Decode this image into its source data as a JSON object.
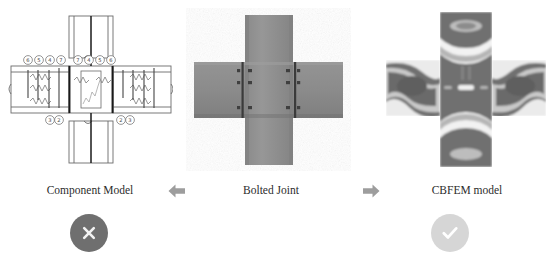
{
  "figure": {
    "background_color": "#ffffff"
  },
  "panels": [
    {
      "id": "component-model",
      "caption": "Component Model",
      "type": "line-drawing",
      "description": "Schematic component method model of a bolted beam-to-column joint with spring components",
      "component_labels_top": [
        "6",
        "5",
        "4",
        "7",
        "7",
        "4",
        "5",
        "6"
      ],
      "component_labels_bottom": [
        "3",
        "2",
        "2",
        "3"
      ],
      "stroke_color": "#555555",
      "fill_color": "#ffffff"
    },
    {
      "id": "bolted-joint",
      "caption": "Bolted Joint",
      "type": "photo",
      "description": "Grayscale photo of a cruciform bolted end-plate joint, column vertical and beams horizontal",
      "base_color": "#8c8c8c",
      "column_color": "#8f8f8f",
      "plate_color": "#4a4a4a",
      "bolt_count": 8
    },
    {
      "id": "cbfem-model",
      "caption": "CBFEM model",
      "type": "contour-plot",
      "description": "Component based finite element model stress contour plot in grayscale",
      "contour_colors": [
        "#6b6b6b",
        "#8f8f8f",
        "#bdbdbd",
        "#e6e6e6",
        "#ffffff"
      ]
    }
  ],
  "arrows": [
    {
      "id": "arrow-left",
      "direction": "left",
      "color": "#9d9d9d",
      "label": "derives from"
    },
    {
      "id": "arrow-right",
      "direction": "right",
      "color": "#9d9d9d",
      "label": "leads to"
    }
  ],
  "badges": [
    {
      "id": "badge-reject",
      "icon": "cross-icon",
      "symbol": "✕",
      "circle_color": "#6f6f6f",
      "mark_color": "#f2f2f2",
      "meaning": "not recommended"
    },
    {
      "id": "badge-accept",
      "icon": "check-icon",
      "symbol": "✓",
      "circle_color": "#d6d6d6",
      "mark_color": "#ffffff",
      "meaning": "recommended"
    }
  ]
}
